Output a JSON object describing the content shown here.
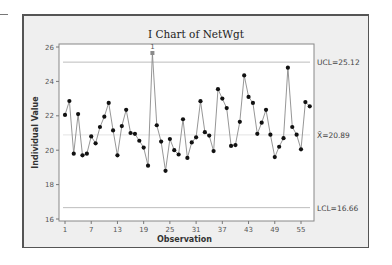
{
  "chart_data": {
    "type": "line",
    "title": "I Chart of NetWgt",
    "xlabel": "Observation",
    "ylabel": "Individual Value",
    "xlim": [
      0,
      58
    ],
    "ylim": [
      16,
      26
    ],
    "x_ticks": [
      1,
      7,
      13,
      19,
      25,
      31,
      37,
      43,
      49,
      55
    ],
    "y_ticks": [
      16,
      18,
      20,
      22,
      24,
      26
    ],
    "grid": false,
    "control_lines": {
      "UCL": {
        "value": 25.12,
        "label": "UCL=25.12"
      },
      "center": {
        "value": 20.89,
        "label": "X̄=20.89"
      },
      "LCL": {
        "value": 16.66,
        "label": "LCL=16.66"
      }
    },
    "out_of_control": [
      {
        "observation": 21,
        "flag": "1"
      }
    ],
    "series": [
      {
        "name": "NetWgt",
        "x": [
          1,
          2,
          3,
          4,
          5,
          6,
          7,
          8,
          9,
          10,
          11,
          12,
          13,
          14,
          15,
          16,
          17,
          18,
          19,
          20,
          21,
          22,
          23,
          24,
          25,
          26,
          27,
          28,
          29,
          30,
          31,
          32,
          33,
          34,
          35,
          36,
          37,
          38,
          39,
          40,
          41,
          42,
          43,
          44,
          45,
          46,
          47,
          48,
          49,
          50,
          51,
          52,
          53,
          54,
          55,
          56,
          57
        ],
        "values": [
          22.05,
          22.86,
          19.8,
          22.1,
          19.7,
          19.8,
          20.8,
          20.4,
          21.35,
          21.95,
          22.75,
          21.15,
          19.7,
          21.4,
          22.35,
          21.0,
          20.95,
          20.55,
          20.15,
          19.1,
          25.65,
          21.45,
          20.5,
          18.8,
          20.65,
          20.0,
          19.75,
          21.8,
          19.55,
          20.45,
          20.75,
          22.85,
          21.05,
          20.85,
          19.95,
          23.55,
          23.0,
          22.45,
          20.25,
          20.3,
          21.65,
          24.35,
          23.1,
          22.75,
          20.95,
          21.6,
          22.35,
          20.9,
          19.6,
          20.2,
          20.7,
          24.8,
          21.35,
          20.9,
          20.05,
          22.8,
          22.55
        ]
      }
    ]
  },
  "colors": {
    "frame_bg": "#efefef",
    "plot_bg": "#ffffff",
    "line": "#8a8a8a",
    "marker": "#111111",
    "out_of_control_marker": "#8a8a8a",
    "control_line": "#bdbdbd"
  }
}
